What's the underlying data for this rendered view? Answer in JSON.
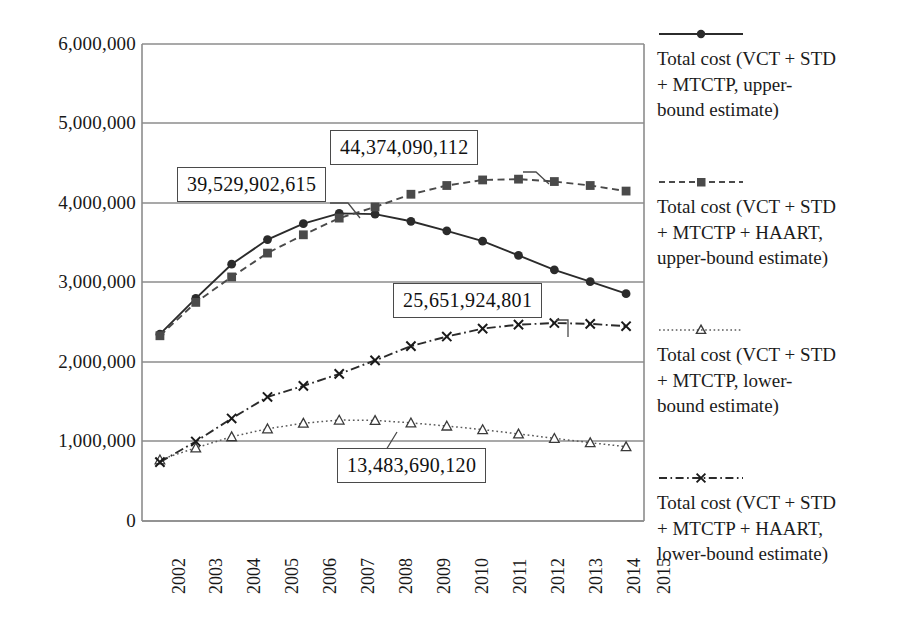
{
  "chart_data": {
    "type": "line",
    "title": "",
    "subtitle": "",
    "xlabel": "",
    "ylabel": "",
    "categories": [
      "2002",
      "2003",
      "2004",
      "2005",
      "2006",
      "2007",
      "2008",
      "2009",
      "2010",
      "2011",
      "2012",
      "2013",
      "2014",
      "2015"
    ],
    "ylim": [
      0,
      6000000
    ],
    "ytick_labels": [
      "6,000,000",
      "5,000,000",
      "4,000,000",
      "3,000,000",
      "2,000,000",
      "1,000,000",
      "0"
    ],
    "ytick_values": [
      6000000,
      5000000,
      4000000,
      3000000,
      2000000,
      1000000,
      0
    ],
    "grid": "horizontal",
    "legend_position": "right",
    "series": [
      {
        "name": "Total cost (VCT + STD + MTCTP, upper-bound estimate)",
        "marker": "circle",
        "line_style": "solid",
        "color": "#2b2b2b",
        "values": [
          2350000,
          2800000,
          3230000,
          3540000,
          3740000,
          3870000,
          3860000,
          3770000,
          3650000,
          3520000,
          3340000,
          3160000,
          3010000,
          2860000
        ]
      },
      {
        "name": "Total cost (VCT + STD + MTCTP + HAART, upper-bound estimate)",
        "marker": "square",
        "line_style": "dashed",
        "color": "#4a4a4a",
        "values": [
          2330000,
          2750000,
          3070000,
          3370000,
          3600000,
          3810000,
          3950000,
          4110000,
          4220000,
          4290000,
          4300000,
          4270000,
          4220000,
          4150000
        ]
      },
      {
        "name": "Total cost (VCT + STD + MTCTP, lower-bound estimate)",
        "marker": "triangle",
        "line_style": "dotted",
        "color": "#5a5a5a",
        "values": [
          770000,
          920000,
          1060000,
          1160000,
          1230000,
          1270000,
          1265000,
          1235000,
          1195000,
          1150000,
          1095000,
          1040000,
          985000,
          935000
        ]
      },
      {
        "name": "Total cost (VCT + STD + MTCTP + HAART, lower-bound estimate)",
        "marker": "cross",
        "line_style": "dashdot",
        "color": "#2b2b2b",
        "values": [
          740000,
          1000000,
          1290000,
          1560000,
          1700000,
          1850000,
          2020000,
          2200000,
          2320000,
          2420000,
          2470000,
          2490000,
          2480000,
          2450000
        ]
      }
    ],
    "annotations": [
      {
        "text": "39,529,902,615",
        "series": "Total cost (VCT + STD + MTCTP, upper-bound estimate)",
        "category": "2007"
      },
      {
        "text": "44,374,090,112",
        "series": "Total cost (VCT + STD + MTCTP + HAART, upper-bound estimate)",
        "category": "2012"
      },
      {
        "text": "25,651,924,801",
        "series": "Total cost (VCT + STD + MTCTP + HAART, lower-bound estimate)",
        "category": "2012"
      },
      {
        "text": "13,483,690,120",
        "series": "Total cost (VCT + STD + MTCTP, lower-bound estimate)",
        "category": "2008"
      }
    ]
  },
  "axis": {
    "ytick_0": "6,000,000",
    "ytick_1": "5,000,000",
    "ytick_2": "4,000,000",
    "ytick_3": "3,000,000",
    "ytick_4": "2,000,000",
    "ytick_5": "1,000,000",
    "ytick_6": "0",
    "xtick_0": "2002",
    "xtick_1": "2003",
    "xtick_2": "2004",
    "xtick_3": "2005",
    "xtick_4": "2006",
    "xtick_5": "2007",
    "xtick_6": "2008",
    "xtick_7": "2009",
    "xtick_8": "2010",
    "xtick_9": "2011",
    "xtick_10": "2012",
    "xtick_11": "2013",
    "xtick_12": "2014",
    "xtick_13": "2015"
  },
  "annotations": {
    "a0": "39,529,902,615",
    "a1": "44,374,090,112",
    "a2": "25,651,924,801",
    "a3": "13,483,690,120"
  },
  "legend": {
    "items": [
      {
        "label": "Total cost (VCT + STD\n+ MTCTP, upper-\nbound estimate)",
        "marker": "circle-marker",
        "line_style": "solid"
      },
      {
        "label": "Total cost (VCT + STD\n+ MTCTP + HAART,\nupper-bound estimate)",
        "marker": "square-marker",
        "line_style": "dashed"
      },
      {
        "label": "Total cost (VCT + STD\n+ MTCTP, lower-\nbound estimate)",
        "marker": "triangle-marker",
        "line_style": "dotted"
      },
      {
        "label": "Total cost (VCT + STD\n+ MTCTP + HAART,\nlower-bound estimate)",
        "marker": "cross-marker",
        "line_style": "dashdot"
      }
    ]
  },
  "colors": {
    "axis": "#8c8c8c",
    "grid": "#8c8c8c",
    "series_dark": "#2b2b2b",
    "series_mid": "#4a4a4a",
    "text": "#181818",
    "background": "#ffffff"
  }
}
